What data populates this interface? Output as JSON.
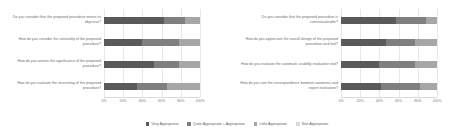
{
  "chart_data": {
    "type": "bar",
    "subtype": "stacked-horizontal-100-percent",
    "title": "",
    "xlabel": "",
    "ylabel": "",
    "xlim": [
      0,
      100
    ],
    "grid": true,
    "legend_position": "bottom",
    "legend": [
      {
        "name": "Very Appropriate",
        "color": "#5a5a5a"
      },
      {
        "name": "Quite Appropriate + Appropriate",
        "color": "#7f7f7f"
      },
      {
        "name": "Little Appropriate",
        "color": "#a6a6a6"
      },
      {
        "name": "Non Appropriate",
        "color": "#d9d9d9"
      }
    ],
    "tick_labels": [
      "0%",
      "20%",
      "40%",
      "60%",
      "80%",
      "100%"
    ],
    "tick_values": [
      0,
      20,
      40,
      60,
      80,
      100
    ],
    "panels": [
      {
        "name": "left-panel",
        "categories": [
          "Do you consider that the proposed procedure meets its objective?",
          "How do you consider the rationality of the proposed procedure?",
          "How do you assess the significance of the proposed procedure?",
          "How do you evaluate the structuring of the proposed procedure?"
        ],
        "series": [
          {
            "name": "Very Appropriate",
            "values": [
              62,
              40,
              52,
              34
            ]
          },
          {
            "name": "Quite Appropriate + Appropriate",
            "values": [
              22,
              38,
              26,
              32
            ]
          },
          {
            "name": "Little Appropriate",
            "values": [
              16,
              22,
              22,
              34
            ]
          },
          {
            "name": "Non Appropriate",
            "values": [
              0,
              0,
              0,
              0
            ]
          }
        ]
      },
      {
        "name": "right-panel",
        "categories": [
          "Do you consider that the proposed procedure is contextualizable?",
          "How do you appreciate the overall design of the proposed procedure and tool?",
          "How do you evaluate the automatic usability evaluation tool?",
          "How do you rate the correspondence between automatic and expert evaluation?"
        ],
        "series": [
          {
            "name": "Very Appropriate",
            "values": [
              57,
              47,
              40,
              42
            ]
          },
          {
            "name": "Quite Appropriate + Appropriate",
            "values": [
              32,
              30,
              37,
              40
            ]
          },
          {
            "name": "Little Appropriate",
            "values": [
              11,
              23,
              23,
              18
            ]
          },
          {
            "name": "Non Appropriate",
            "values": [
              0,
              0,
              0,
              0
            ]
          }
        ]
      }
    ]
  }
}
